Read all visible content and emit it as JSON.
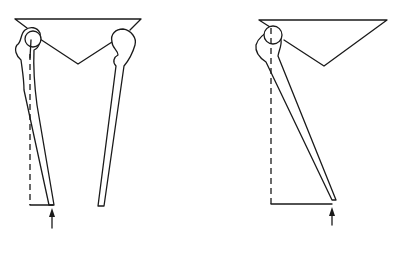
{
  "diagram": {
    "colors": {
      "stroke": "#1a1a1a",
      "background": "#ffffff"
    },
    "panels": [
      {
        "id": "left",
        "label": "Bilateral stance",
        "elements": [
          "pelvis-triangle",
          "left-femur",
          "right-femur",
          "load-line-dashed",
          "ground-reaction-arrow"
        ]
      },
      {
        "id": "right",
        "label": "Single-leg stance",
        "elements": [
          "pelvis-triangle",
          "femur",
          "load-line-dashed",
          "horizontal-offset-line",
          "ground-reaction-arrow"
        ]
      }
    ]
  }
}
